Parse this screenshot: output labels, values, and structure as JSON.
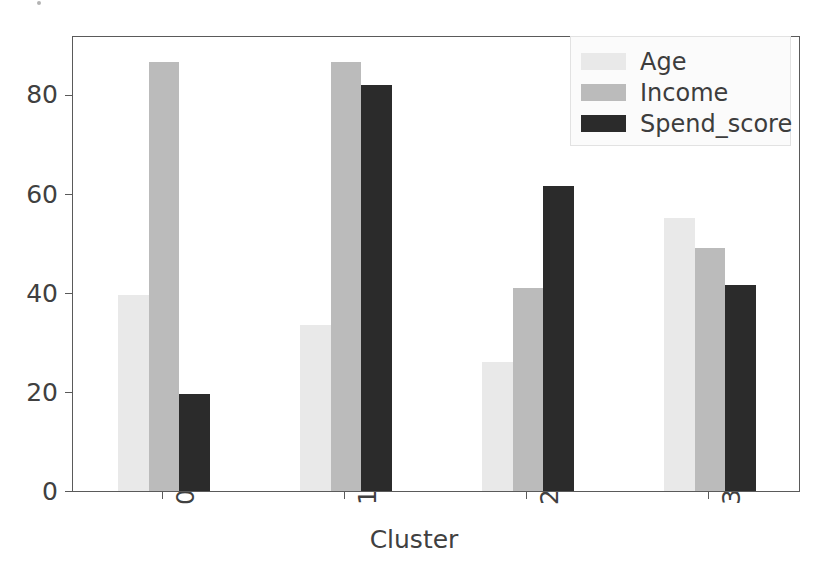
{
  "chart_data": {
    "type": "bar",
    "title": "",
    "xlabel": "Cluster",
    "ylabel": "",
    "categories": [
      "0",
      "1",
      "2",
      "3"
    ],
    "series": [
      {
        "name": "Age",
        "color": "#e9e9e9",
        "values": [
          39.5,
          33.5,
          26.0,
          55.0
        ]
      },
      {
        "name": "Income",
        "color": "#bbbbbb",
        "values": [
          86.5,
          86.5,
          41.0,
          49.0
        ]
      },
      {
        "name": "Spend_score",
        "color": "#2b2b2b",
        "values": [
          19.5,
          82.0,
          61.5,
          41.5
        ]
      }
    ],
    "ylim": [
      0,
      92
    ],
    "yticks": [
      0,
      20,
      40,
      60,
      80
    ],
    "ytick_labels": [
      "0",
      "20",
      "40",
      "60",
      "80"
    ],
    "xtick_labels": [
      "0",
      "1",
      "2",
      "3"
    ],
    "grid": false,
    "legend_position": "upper right",
    "legend_entries": [
      "Age",
      "Income",
      "Spend_score"
    ]
  },
  "axes": {
    "x_axis_title": "Cluster"
  },
  "legend": {
    "items": [
      {
        "label": "Age"
      },
      {
        "label": "Income"
      },
      {
        "label": "Spend_score"
      }
    ]
  }
}
